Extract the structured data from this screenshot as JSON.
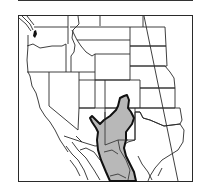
{
  "map": {
    "type": "range-map",
    "region": "Western North America",
    "frame": {
      "x": 18,
      "y": 15,
      "width": 175,
      "height": 167
    },
    "colors": {
      "background": "#ffffff",
      "state_lines": "#2a2a2a",
      "range_fill": "#b8b8b8",
      "range_outline": "#111111"
    },
    "layers": [
      {
        "name": "state-boundaries",
        "style": "thin black lines"
      },
      {
        "name": "range-area",
        "style": "gray fill with thick black outline"
      }
    ]
  }
}
